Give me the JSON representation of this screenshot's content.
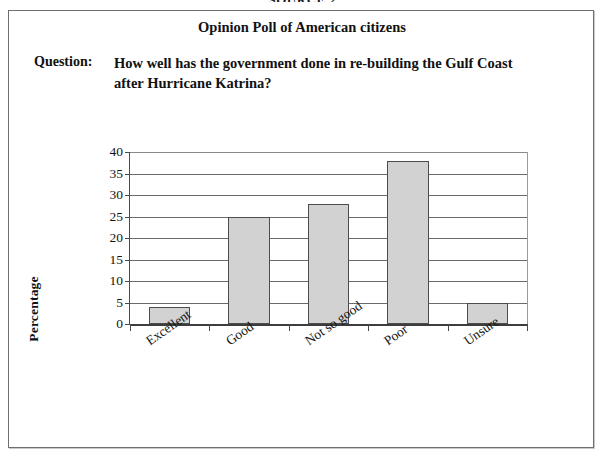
{
  "source_caption": "SOURCE 2",
  "poll": {
    "title": "Opinion Poll of American citizens",
    "question_label": "Question:",
    "question_text": "How well has the government done in re-building the Gulf Coast after Hurricane Katrina?"
  },
  "chart_data": {
    "type": "bar",
    "title": "",
    "xlabel": "",
    "ylabel": "Percentage",
    "categories": [
      "Excellent",
      "Good",
      "Not so good",
      "Poor",
      "Unsure"
    ],
    "values": [
      4,
      25,
      28,
      38,
      5
    ],
    "ylim": [
      0,
      40
    ],
    "ytick_labels": [
      "0",
      "5",
      "10",
      "15",
      "20",
      "25",
      "30",
      "35",
      "40"
    ],
    "ytick_values": [
      0,
      5,
      10,
      15,
      20,
      25,
      30,
      35,
      40
    ],
    "grid": true,
    "legend": "none",
    "bar_fill_color": "#d2d2d2",
    "bar_border_color": "#4c4c4c",
    "axis_color": "#4a4a4a"
  }
}
